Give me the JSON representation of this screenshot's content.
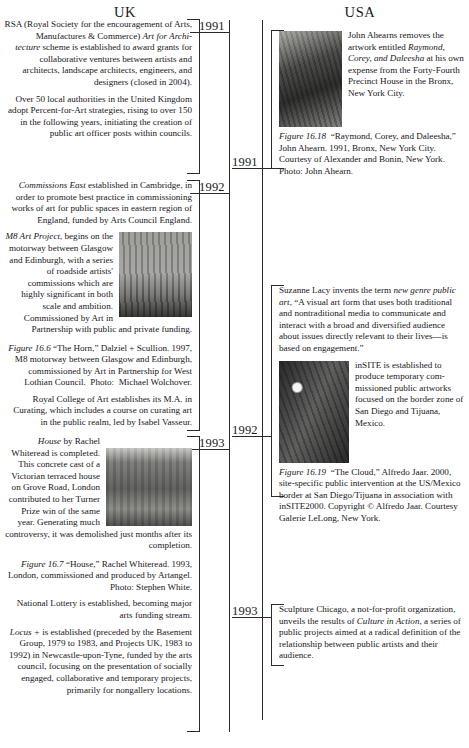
{
  "headers": {
    "uk": "UK",
    "usa": "USA"
  },
  "years": {
    "uk": [
      "1991",
      "1992",
      "1993"
    ],
    "usa": [
      "1991",
      "1992",
      "1993"
    ]
  },
  "uk_entries": [
    {
      "year": "1991",
      "paragraphs": [
        "RSA (Royal Society for the encouragement of Arts, Manufactures & Commerce) Art for Architecture scheme is established to award grants for collaborative ventures between artists and architects, landscape architects, engineers, and designers (closed in 2004).",
        "Over 50 local authorities in the United Kingdom adopt Percent-for-Art strategies, rising to over 150 in the following years, initiating the creation of public art officer posts within councils."
      ],
      "italics": [
        "Art for Architecture"
      ]
    },
    {
      "year": "1992",
      "paragraphs": [
        "Commissions East established in Cambridge, in order to promote best practice in commissioning works of art for public spaces in eastern region of England, funded by Arts Council England.",
        "M8 Art Project, begins on the motorway between Glasgow and Edinburgh, with a series of roadside artists' commissions which are highly significant in both scale and ambition. Commissioned by Art in Partnership with public and private funding.",
        "Royal College of Art establishes its M.A. in Curating, which includes a course on curating art in the public realm, led by Isabel Vasseur."
      ],
      "figure": {
        "label": "Figure 16.6",
        "caption": "“The Horn,” Dalziel + Scullion. 1997, M8 motorway between Glasgow and Edinburgh, commissioned by Art in Partnership for West Lothian Council. Photo: Michael Wolchover.",
        "image_name": "horn-sculpture-photo"
      }
    },
    {
      "year": "1993",
      "paragraphs": [
        "House by Rachel Whiteread is completed. This concrete cast of a Victorian terraced house on Grove Road, London contributed to her Turner Prize win of the same year. Generating much controversy, it was demolished just months after its completion.",
        "National Lottery is established, becoming major arts funding stream.",
        "Locus + is established (preceded by the Basement Group, 1979 to 1983, and Projects UK, 1983 to 1992) in Newcastle-upon-Tyne, funded by the arts council, focusing on the presentation of socially engaged, collaborative and temporary projects, primarily for nongallery locations."
      ],
      "figure": {
        "label": "Figure 16.7",
        "caption": "“House,” Rachel Whiteread. 1993, London, commissioned and produced by Artangel. Photo: Stephen White.",
        "image_name": "whiteread-house-photo"
      }
    }
  ],
  "usa_entries": [
    {
      "year": "1991",
      "paragraphs": [
        "John Ahearns removes the artwork entitled Raymond, Corey, and Daleesha at his own expense from the Forty-Fourth Precinct House in the Bronx, New York City."
      ],
      "figure": {
        "label": "Figure 16.18",
        "caption": "“Raymond, Corey, and Daleesha,” John Ahearn. 1991, Bronx, New York City. Courtesy of Alexander and Bonin, New York. Photo: John Ahearn.",
        "image_name": "ahearn-sculpture-photo"
      }
    },
    {
      "year": "1992",
      "paragraphs": [
        "Suzanne Lacy invents the term new genre public art, “A visual art form that uses both traditional and nontraditional media to communicate and interact with a broad and diversified audience about issues directly relevant to their lives—is based on engagement.”",
        "inSITE is established to produce temporary commissioned public artworks focused on the border zone of San Diego and Tijuana, Mexico."
      ],
      "figure": {
        "label": "Figure 16.19",
        "caption": "“The Cloud,” Alfredo Jaar. 2000, site-specific public intervention at the US/Mexico border at San Diego/Tijuana in association with inSITE2000. Copyright © Alfredo Jaar. Courtesy Galerie LeLong, New York.",
        "image_name": "the-cloud-photo"
      }
    },
    {
      "year": "1993",
      "paragraphs": [
        "Sculpture Chicago, a not-for-profit organization, unveils the results of Culture in Action, a series of public projects aimed at a radical definition of the relationship between public artists and their audience."
      ]
    }
  ],
  "colors": {
    "ink": "#17161a",
    "rule": "#2b2a2e",
    "page": "#ffffff"
  }
}
